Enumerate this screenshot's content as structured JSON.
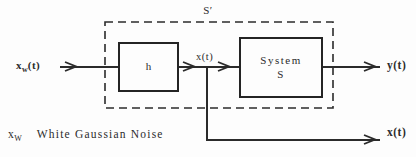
{
  "diagram": {
    "outer_label": "S′",
    "input_signal": {
      "base": "x",
      "sub": "w",
      "suffix": "(t)"
    },
    "filter_block_label": "h",
    "system_block": {
      "line1": "System",
      "line2": "S"
    },
    "intermediate_signal": "x(t)",
    "output_top_signal": "y(t)",
    "output_bottom_signal": "x(t)",
    "caption": {
      "symbol_base": "x",
      "symbol_sub": "W",
      "text": "White Gaussian Noise"
    },
    "colors": {
      "ink": "#2b2b2b",
      "background": "#fdfdfd"
    }
  }
}
